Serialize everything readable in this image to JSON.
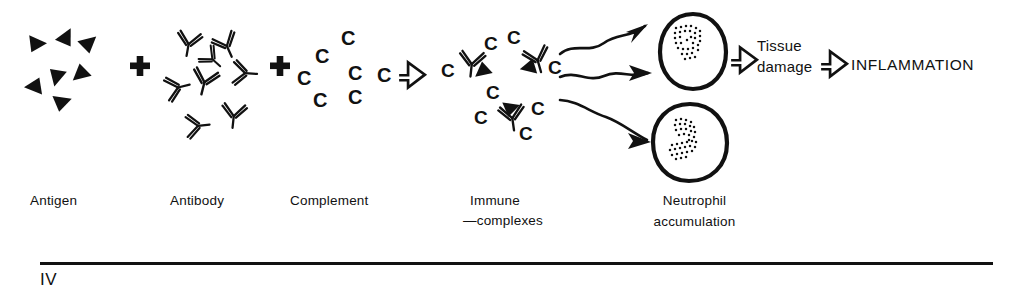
{
  "figure": {
    "type": "flow-diagram",
    "roman_numeral": "IV",
    "ink_color": "#111111",
    "background_color": "#ffffff"
  },
  "stages": [
    {
      "id": "antigen",
      "label": "Antigen",
      "glyph": "filled-triangles",
      "count": 7
    },
    {
      "id": "antibody",
      "label": "Antibody",
      "glyph": "y-shaped-antibodies",
      "count": 8
    },
    {
      "id": "complement",
      "label": "Complement",
      "glyph": "letter-c",
      "count": 7,
      "letter": "C"
    },
    {
      "id": "immune-complexes",
      "label_line1": "Immune",
      "label_line2": "—complexes",
      "glyph": "antibody-antigen-complement-complex",
      "count": 3
    },
    {
      "id": "neutrophil",
      "label_line1": "Neutrophil",
      "label_line2": "accumulation",
      "glyph": "stippled-nucleus-cell",
      "count": 2
    },
    {
      "id": "tissue-damage",
      "label_line1": "Tissue",
      "label_line2": "damage"
    },
    {
      "id": "inflammation",
      "label": "INFLAMMATION"
    }
  ],
  "operators": [
    {
      "id": "plus-1",
      "symbol": "+",
      "between": [
        "antigen",
        "antibody"
      ]
    },
    {
      "id": "plus-2",
      "symbol": "+",
      "between": [
        "antibody",
        "complement"
      ]
    }
  ],
  "arrows": {
    "block": [
      {
        "id": "block-arrow-1",
        "from": "complement",
        "to": "immune-complexes"
      },
      {
        "id": "block-arrow-2",
        "from": "neutrophil",
        "to": "tissue-damage"
      },
      {
        "id": "block-arrow-3",
        "from": "tissue-damage",
        "to": "inflammation"
      }
    ],
    "wavy": [
      {
        "id": "wavy-arrow-1",
        "from": "immune-complexes",
        "to": "neutrophil-upper"
      },
      {
        "id": "wavy-arrow-2",
        "from": "immune-complexes",
        "to": "neutrophil-upper"
      },
      {
        "id": "wavy-arrow-3",
        "from": "immune-complexes",
        "to": "neutrophil-lower"
      }
    ]
  },
  "complement_letters": {
    "free": [
      "C",
      "C",
      "C",
      "C",
      "C",
      "C",
      "C"
    ],
    "complex_1": [
      "C",
      "C"
    ],
    "complex_2": [
      "C",
      "C"
    ],
    "complex_3": [
      "C",
      "C",
      "C",
      "C"
    ]
  },
  "footer": {
    "rule": {
      "x_start": 40,
      "x_end": 993,
      "y": 262,
      "thickness": 3
    },
    "roman": "IV"
  }
}
